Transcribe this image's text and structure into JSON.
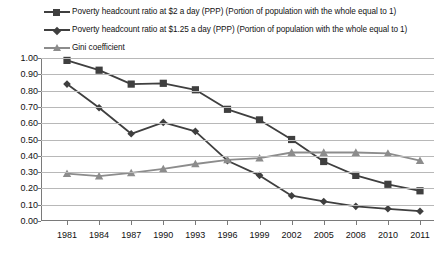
{
  "chart_data": {
    "type": "line",
    "title": "",
    "xlabel": "",
    "ylabel": "",
    "ylim": [
      0.0,
      1.0
    ],
    "ytick_step": 0.1,
    "grid": true,
    "legend_position": "top-left",
    "categories": [
      "1981",
      "1984",
      "1987",
      "1990",
      "1993",
      "1996",
      "1999",
      "2002",
      "2005",
      "2008",
      "2010",
      "2011"
    ],
    "ytick_labels": [
      "1.00",
      "0.90",
      "0.80",
      "0.70",
      "0.60",
      "0.50",
      "0.40",
      "0.30",
      "0.20",
      "0.10",
      "0.00"
    ],
    "ytick_values": [
      1.0,
      0.9,
      0.8,
      0.7,
      0.6,
      0.5,
      0.4,
      0.3,
      0.2,
      0.1,
      0.0
    ],
    "series": [
      {
        "name": "Poverty headcount ratio at $2 a day (PPP) (Portion of population with the whole equal to 1)",
        "marker": "square",
        "color": "#3f3f3f",
        "values": [
          0.985,
          0.925,
          0.84,
          0.845,
          0.805,
          0.685,
          0.62,
          0.5,
          0.365,
          0.28,
          0.225,
          0.185
        ]
      },
      {
        "name": "Poverty headcount ratio at $1.25 a day (PPP) (Portion of population with the whole equal to 1)",
        "marker": "diamond",
        "color": "#3f3f3f",
        "values": [
          0.84,
          0.695,
          0.535,
          0.605,
          0.55,
          0.37,
          0.28,
          0.155,
          0.12,
          0.09,
          0.075,
          0.06
        ]
      },
      {
        "name": "Gini coefficient",
        "marker": "triangle",
        "color": "#8c8c8c",
        "values": [
          0.29,
          0.275,
          0.295,
          0.32,
          0.35,
          0.375,
          0.385,
          0.42,
          0.42,
          0.42,
          0.415,
          0.37
        ]
      }
    ]
  },
  "legend": {
    "items": [
      {
        "label": "Poverty headcount ratio at $2 a day (PPP) (Portion of population with the whole equal to 1)",
        "marker": "square",
        "color": "#3f3f3f"
      },
      {
        "label": "Poverty headcount ratio at $1.25 a day (PPP) (Portion of population with the whole equal to 1)",
        "marker": "diamond",
        "color": "#3f3f3f"
      },
      {
        "label": "Gini coefficient",
        "marker": "triangle",
        "color": "#8c8c8c"
      }
    ]
  },
  "colors": {
    "series_dark": "#3f3f3f",
    "series_gray": "#8c8c8c",
    "gridline": "#b8b8b8",
    "axis": "#7a7a7a",
    "text": "#111111",
    "background": "#ffffff"
  }
}
